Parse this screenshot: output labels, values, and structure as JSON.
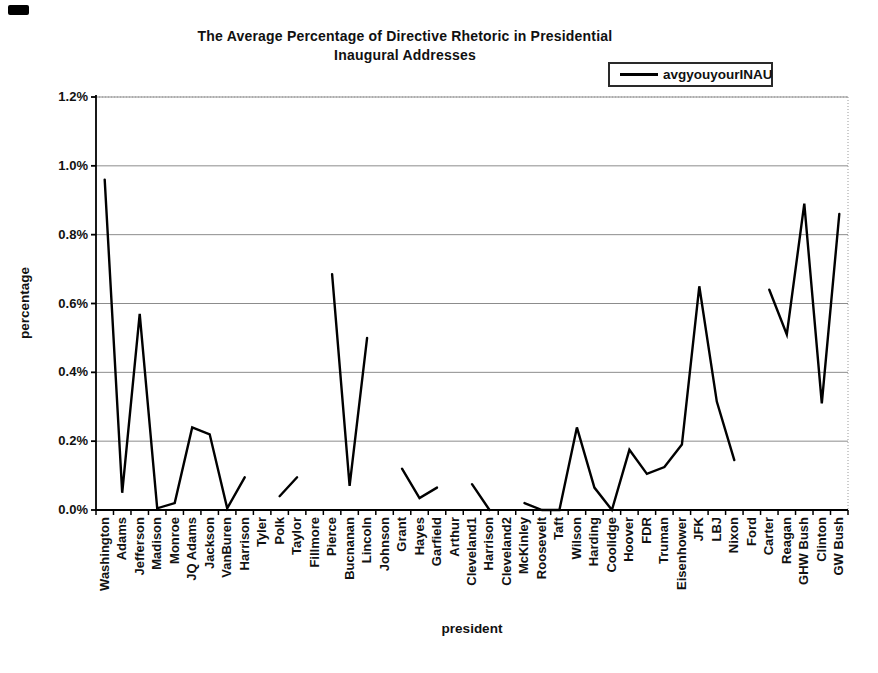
{
  "page": {
    "background": "#ffffff"
  },
  "title": {
    "line1": "The Average Percentage of Directive Rhetoric in Presidential",
    "line2": "Inaugural Addresses"
  },
  "legend": {
    "label": "avgyouyourINAU",
    "line_color": "#000000"
  },
  "axes": {
    "x_title": "president",
    "y_title": "percentage"
  },
  "chart_data": {
    "type": "line",
    "title": "The Average Percentage of Directive Rhetoric in Presidential Inaugural Addresses",
    "xlabel": "president",
    "ylabel": "percentage",
    "units": "percent",
    "ylim": [
      0,
      1.2
    ],
    "ytick_values": [
      0,
      0.2,
      0.4,
      0.6,
      0.8,
      1.0,
      1.2
    ],
    "ytick_labels": [
      "0.0%",
      "0.2%",
      "0.4%",
      "0.6%",
      "0.8%",
      "1.0%",
      "1.2%"
    ],
    "grid": "horizontal-gridlines-on",
    "legend_position": "top-right",
    "line_color": "#000000",
    "missing_data_note": "gaps in line where value is null",
    "categories": [
      "Washington",
      "Adams",
      "Jefferson",
      "Madison",
      "Monroe",
      "JQ Adams",
      "Jackson",
      "VanBuren",
      "Harrison",
      "Tyler",
      "Polk",
      "Taylor",
      "Fillmore",
      "Pierce",
      "Bucnanan",
      "Lincoln",
      "Johnson",
      "Grant",
      "Hayes",
      "Garfield",
      "Arthur",
      "Cleveland1",
      "Harrison",
      "Cleveland2",
      "McKinley",
      "Roosevelt",
      "Taft",
      "Wilson",
      "Harding",
      "Coolidge",
      "Hoover",
      "FDR",
      "Truman",
      "Eisenhower",
      "JFK",
      "LBJ",
      "Nixon",
      "Ford",
      "Carter",
      "Reagan",
      "GHW Bush",
      "Clinton",
      "GW Bush"
    ],
    "series": [
      {
        "name": "avgyouyourINAU",
        "values": [
          0.96,
          0.05,
          0.57,
          0.005,
          0.02,
          0.24,
          0.22,
          0.005,
          0.095,
          null,
          0.04,
          0.095,
          null,
          0.685,
          0.07,
          0.5,
          null,
          0.12,
          0.035,
          0.065,
          null,
          0.075,
          0.0,
          null,
          0.02,
          0.0,
          0.0,
          0.24,
          0.065,
          0.0,
          0.175,
          0.105,
          0.125,
          0.19,
          0.65,
          0.315,
          0.145,
          null,
          0.64,
          0.51,
          0.89,
          0.31,
          0.86
        ]
      }
    ]
  }
}
